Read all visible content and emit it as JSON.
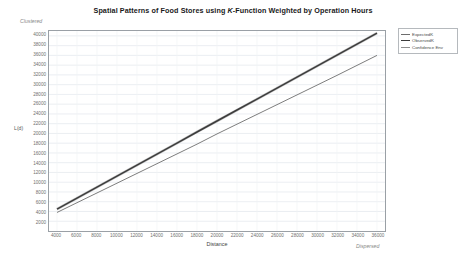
{
  "chart_data": {
    "type": "line",
    "title": "Spatial Patterns of Food Stores using K-Function Weighted by Operation Hours",
    "title_pre": "Spatial Patterns of Food Stores using ",
    "title_italic": "K",
    "title_post": "-Function Weighted by Operation Hours",
    "xlabel": "Distance",
    "ylabel": "L(d)",
    "xlim": [
      3200,
      36800
    ],
    "ylim": [
      0,
      41000
    ],
    "grid": true,
    "legend_position": "outside-top-right",
    "annotations": [
      {
        "name": "clustered",
        "text": "Clustered",
        "position": "top-left"
      },
      {
        "name": "dispersed",
        "text": "Dispersed",
        "position": "bottom-right"
      }
    ],
    "xticks": [
      4000,
      6000,
      8000,
      10000,
      12000,
      14000,
      16000,
      18000,
      20000,
      22000,
      24000,
      26000,
      28000,
      30000,
      32000,
      34000,
      36000
    ],
    "xtick_labels": [
      "4000",
      "6000",
      "8000",
      "10000",
      "12000",
      "14000",
      "16000",
      "18000",
      "20000",
      "22000",
      "24000",
      "26000",
      "28000",
      "30000",
      "32000",
      "34000",
      "36000"
    ],
    "yticks": [
      2000,
      4000,
      6000,
      8000,
      10000,
      12000,
      14000,
      16000,
      18000,
      20000,
      22000,
      24000,
      26000,
      28000,
      30000,
      32000,
      34000,
      36000,
      38000,
      40000
    ],
    "ytick_labels": [
      "2000",
      "4000",
      "6000",
      "8000",
      "10000",
      "12000",
      "14000",
      "16000",
      "18000",
      "20000",
      "22000",
      "24000",
      "26000",
      "28000",
      "30000",
      "32000",
      "34000",
      "36000",
      "38000",
      "40000"
    ],
    "x": [
      4000,
      6000,
      8000,
      10000,
      12000,
      14000,
      16000,
      18000,
      20000,
      22000,
      24000,
      26000,
      28000,
      30000,
      32000,
      34000,
      36000
    ],
    "series": [
      {
        "name": "ExpectedK",
        "color": "#6d6d6d",
        "values": [
          3800,
          5800,
          7800,
          9800,
          11800,
          13800,
          15800,
          17800,
          19900,
          21900,
          23900,
          25900,
          27900,
          29900,
          31900,
          33950,
          36000
        ]
      },
      {
        "name": "ObservedK",
        "color": "#3c3c3c",
        "values": [
          4500,
          6750,
          9000,
          11250,
          13500,
          15750,
          18000,
          20300,
          22550,
          24800,
          27050,
          29300,
          31550,
          33800,
          36050,
          38300,
          40550
        ]
      },
      {
        "name": "Confidence Env",
        "color": "#8f8f8f",
        "values": [
          4500,
          6750,
          9000,
          11250,
          13500,
          15750,
          18000,
          20300,
          22550,
          24800,
          27050,
          29300,
          31550,
          33800,
          36050,
          38300,
          40550
        ]
      }
    ]
  },
  "legend": {
    "items": [
      {
        "label": "ExpectedK",
        "color": "#6d6d6d"
      },
      {
        "label": "ObservedK",
        "color": "#3c3c3c"
      },
      {
        "label": "Confidence Env",
        "color": "#8f8f8f"
      }
    ]
  },
  "colors": {
    "frame": "#9aa0a6",
    "grid": "#e6eaee",
    "expected": "#6d6d6d",
    "observed": "#3c3c3c",
    "confidence": "#8f8f8f",
    "background": "#ffffff",
    "tick_text": "#6f6f6f"
  }
}
